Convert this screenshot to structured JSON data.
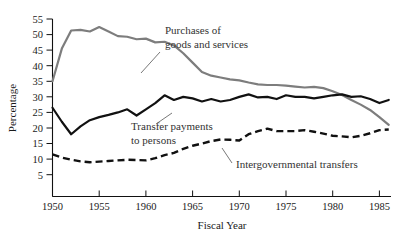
{
  "chart_data": {
    "type": "line",
    "title": "",
    "xlabel": "Fiscal Year",
    "ylabel": "Percentage",
    "xlim": [
      1950,
      1986
    ],
    "ylim": [
      0,
      57
    ],
    "ytick_labels": [
      "55",
      "50",
      "45",
      "40",
      "35",
      "30",
      "25",
      "20",
      "15",
      "10",
      "5"
    ],
    "ytick_values": [
      55,
      50,
      45,
      40,
      35,
      30,
      25,
      20,
      15,
      10,
      5
    ],
    "xtick_labels": [
      "1950",
      "1955",
      "1960",
      "1965",
      "1970",
      "1975",
      "1980",
      "1985"
    ],
    "xtick_values": [
      1950,
      1955,
      1960,
      1965,
      1970,
      1975,
      1980,
      1985
    ],
    "grid": false,
    "legend": "inline-annotations",
    "x": [
      1950,
      1951,
      1952,
      1953,
      1954,
      1955,
      1956,
      1957,
      1958,
      1959,
      1960,
      1961,
      1962,
      1963,
      1964,
      1965,
      1966,
      1967,
      1968,
      1969,
      1970,
      1971,
      1972,
      1973,
      1974,
      1975,
      1976,
      1977,
      1978,
      1979,
      1980,
      1981,
      1982,
      1983,
      1984,
      1985,
      1986
    ],
    "series": [
      {
        "name": "Purchases of goods and services",
        "color": "#7d7d7d",
        "style": "solid",
        "values": [
          35.0,
          45.5,
          51.3,
          51.5,
          51.0,
          52.4,
          51.0,
          49.5,
          49.3,
          48.5,
          48.7,
          47.5,
          47.7,
          46.5,
          44.0,
          41.0,
          38.0,
          36.8,
          36.2,
          35.6,
          35.3,
          34.6,
          34.0,
          33.8,
          33.8,
          33.6,
          33.3,
          33.0,
          33.2,
          32.8,
          31.8,
          30.6,
          29.0,
          27.5,
          25.8,
          23.5,
          21.0
        ]
      },
      {
        "name": "Transfer payments to persons",
        "color": "#111111",
        "style": "solid",
        "values": [
          26.5,
          22.0,
          18.0,
          20.5,
          22.5,
          23.5,
          24.2,
          25.0,
          26.0,
          24.0,
          26.0,
          28.0,
          30.5,
          29.0,
          30.0,
          29.5,
          28.5,
          29.3,
          28.5,
          29.0,
          30.0,
          30.8,
          29.8,
          30.0,
          29.3,
          30.5,
          30.0,
          30.0,
          29.5,
          30.0,
          30.5,
          30.8,
          30.0,
          30.2,
          29.3,
          28.0,
          29.0
        ]
      },
      {
        "name": "Intergovernmental transfers",
        "color": "#111111",
        "style": "dashed",
        "values": [
          11.5,
          10.5,
          9.8,
          9.3,
          9.0,
          9.2,
          9.4,
          9.6,
          9.8,
          9.7,
          9.6,
          10.3,
          11.3,
          12.0,
          13.3,
          14.3,
          15.0,
          15.8,
          16.3,
          16.2,
          16.0,
          18.0,
          19.0,
          19.8,
          19.0,
          19.0,
          19.0,
          19.3,
          18.8,
          18.2,
          17.5,
          17.3,
          17.0,
          17.5,
          18.3,
          19.3,
          19.5
        ]
      }
    ]
  },
  "annotations": {
    "purchases": {
      "line1": "Purchases of",
      "line2": "goods and services"
    },
    "transfer": {
      "line1": "Transfer payments",
      "line2": "to persons"
    },
    "intergov": {
      "line1": "Intergovernmental transfers"
    }
  },
  "axes": {
    "y_title": "Percentage",
    "x_title": "Fiscal Year"
  }
}
